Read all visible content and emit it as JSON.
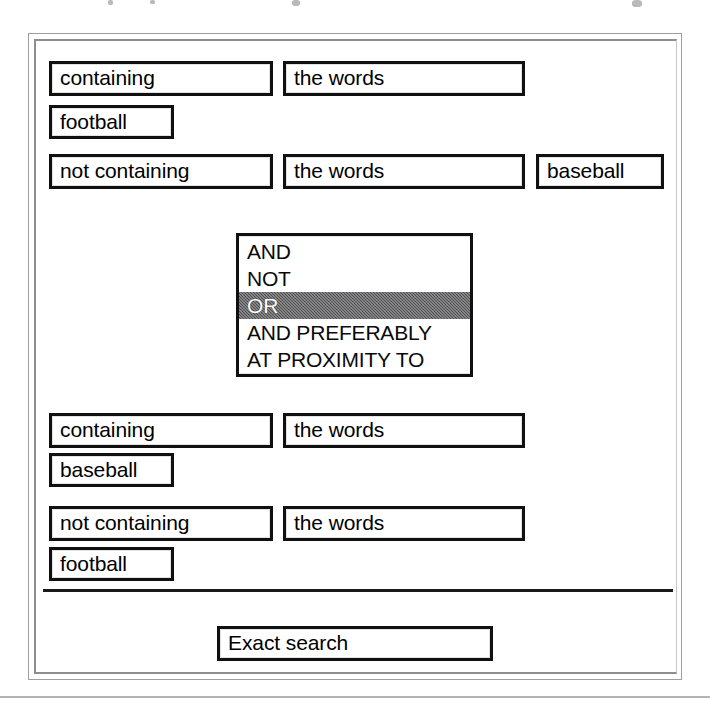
{
  "document": {
    "title": "Boolean query builder form"
  },
  "query_block_1": {
    "row1": {
      "operator_field": "containing",
      "target_field": "the words"
    },
    "row2": {
      "term_field": "football"
    },
    "row3": {
      "operator_field": "not containing",
      "target_field": "the words",
      "term_field": "baseball"
    }
  },
  "connector": {
    "label": "connector-operator-list",
    "selected": "OR",
    "options": [
      "AND",
      "NOT",
      "OR",
      "AND PREFERABLY",
      "AT PROXIMITY TO"
    ],
    "highlight_color": "#4f4f52",
    "highlight_text_color": "#ffffff"
  },
  "query_block_2": {
    "row1": {
      "operator_field": "containing",
      "target_field": "the words"
    },
    "row2": {
      "term_field": "baseball"
    },
    "row3": {
      "operator_field": "not containing",
      "target_field": "the words"
    },
    "row4": {
      "term_field": "football"
    }
  },
  "actions": {
    "submit_label": "Exact search"
  }
}
